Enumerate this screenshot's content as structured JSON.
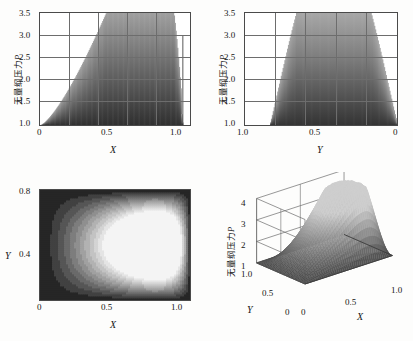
{
  "figure": {
    "ylabel_cn": "无量纲压力",
    "ylabel_sym": "P",
    "xlabel_X": "X",
    "xlabel_Y": "Y"
  },
  "chart_data": [
    {
      "id": "top-left",
      "type": "area",
      "title": "",
      "xlabel": "X",
      "ylabel": "无量纲压力P",
      "xlim": [
        0,
        1.05
      ],
      "ylim": [
        1.0,
        3.5
      ],
      "xticks": [
        "0",
        "0.5",
        "1.0"
      ],
      "xtick_values": [
        0,
        0.5,
        1.0
      ],
      "yticks": [
        "1.0",
        "1.5",
        "2.0",
        "2.5",
        "3.0",
        "3.5"
      ],
      "ytick_values": [
        1.0,
        1.5,
        2.0,
        2.5,
        3.0,
        3.5
      ],
      "grid": true,
      "legend": "none",
      "x": [
        0.0,
        0.05,
        0.1,
        0.15,
        0.2,
        0.25,
        0.3,
        0.35,
        0.4,
        0.45,
        0.5,
        0.55,
        0.6,
        0.65,
        0.7,
        0.75,
        0.8,
        0.85,
        0.9,
        0.93,
        0.95,
        0.96,
        0.97,
        0.98,
        0.99,
        1.0
      ],
      "values": [
        1.0,
        1.02,
        1.05,
        1.08,
        1.12,
        1.17,
        1.23,
        1.3,
        1.38,
        1.48,
        1.59,
        1.72,
        1.87,
        2.04,
        2.24,
        2.46,
        2.7,
        2.94,
        3.13,
        3.19,
        3.21,
        3.2,
        3.15,
        2.95,
        2.2,
        1.0
      ]
    },
    {
      "id": "top-right",
      "type": "area",
      "title": "",
      "xlabel": "Y",
      "ylabel": "无量纲压力P",
      "xlim": [
        1.0,
        0.0
      ],
      "ylim": [
        1.0,
        3.5
      ],
      "xticks": [
        "1.0",
        "0.5",
        "0"
      ],
      "xtick_values": [
        1.0,
        0.5,
        0.0
      ],
      "yticks": [
        "1.0",
        "1.5",
        "2.0",
        "2.5",
        "3.0",
        "3.5"
      ],
      "ytick_values": [
        1.0,
        1.5,
        2.0,
        2.5,
        3.0,
        3.5
      ],
      "grid": true,
      "legend": "none",
      "x": [
        0.82,
        0.8,
        0.78,
        0.75,
        0.72,
        0.68,
        0.64,
        0.6,
        0.56,
        0.52,
        0.48,
        0.44,
        0.4,
        0.36,
        0.32,
        0.28,
        0.24,
        0.2,
        0.16,
        0.12,
        0.08,
        0.04,
        0.0
      ],
      "values": [
        1.0,
        1.35,
        1.62,
        1.94,
        2.2,
        2.47,
        2.69,
        2.87,
        3.02,
        3.12,
        3.19,
        3.21,
        3.19,
        3.13,
        3.02,
        2.88,
        2.7,
        2.48,
        2.23,
        1.92,
        1.6,
        1.3,
        1.0
      ]
    },
    {
      "id": "bottom-left",
      "type": "heatmap",
      "title": "",
      "xlabel": "X",
      "ylabel": "Y",
      "xlim": [
        0,
        1.0
      ],
      "ylim": [
        0,
        0.8
      ],
      "xticks": [
        "0",
        "0.5",
        "1.0"
      ],
      "xtick_values": [
        0,
        0.5,
        1.0
      ],
      "yticks": [
        "0.4",
        "0.8"
      ],
      "ytick_values": [
        0.4,
        0.8
      ],
      "grid": false,
      "legend": "none",
      "colormap": "gray",
      "peak_x": 0.9,
      "peak_y": 0.4,
      "zmin": 1.0,
      "zmax": 3.2,
      "contour_levels": [
        1.0,
        1.25,
        1.5,
        1.75,
        2.0,
        2.25,
        2.5,
        2.75,
        3.0,
        3.2
      ]
    },
    {
      "id": "bottom-right",
      "type": "surface",
      "title": "",
      "xlabel": "X",
      "ylabel": "Y",
      "zlabel": "无量纲压力P",
      "xlim": [
        0,
        1.0
      ],
      "ylim": [
        1.0,
        0.0
      ],
      "zlim": [
        1,
        4
      ],
      "xticks": [
        "0",
        "0.5",
        "1.0"
      ],
      "xtick_values": [
        0,
        0.5,
        1.0
      ],
      "yticks": [
        "1.0",
        "0.5",
        "0"
      ],
      "ytick_values": [
        1.0,
        0.5,
        0.0
      ],
      "zticks": [
        "1",
        "2",
        "3",
        "4"
      ],
      "ztick_values": [
        1,
        2,
        3,
        4
      ],
      "grid": true,
      "legend": "none",
      "peak_x": 0.9,
      "peak_y": 0.4,
      "peak_z": 3.2
    }
  ]
}
